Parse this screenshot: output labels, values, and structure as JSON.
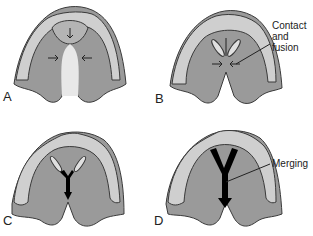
{
  "figure": {
    "colors": {
      "palate_shelf": "#9a9a9a",
      "alveolar_ridge": "#cfcfcf",
      "primary_palate": "#b4b4b4",
      "outline": "#3a3a3a",
      "merge_arrow": "#000000",
      "background": "#ffffff"
    },
    "panels": [
      {
        "id": "A",
        "label": "A",
        "annotation": null
      },
      {
        "id": "B",
        "label": "B",
        "annotation": {
          "lines": [
            "Contact",
            "and",
            "fusion"
          ]
        }
      },
      {
        "id": "C",
        "label": "C",
        "annotation": null
      },
      {
        "id": "D",
        "label": "D",
        "annotation": {
          "lines": [
            "Merging"
          ]
        }
      }
    ]
  }
}
